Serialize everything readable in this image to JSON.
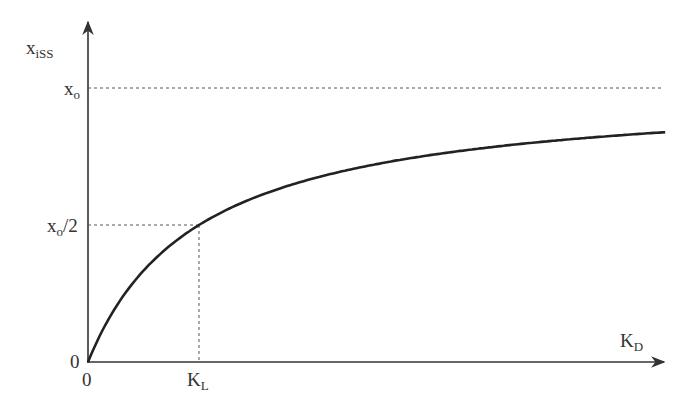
{
  "chart_data": {
    "type": "line",
    "title": "",
    "xlabel": "K_D",
    "ylabel": "x_iSS",
    "xlabel_main": "K",
    "xlabel_sub": "D",
    "ylabel_main": "x",
    "ylabel_sub": "iSS",
    "x_ticks": [
      {
        "label_main": "0",
        "label_sub": "",
        "value": 0
      },
      {
        "label_main": "K",
        "label_sub": "L",
        "value": 1
      }
    ],
    "y_ticks": [
      {
        "label_main": "0",
        "label_sub": "",
        "label_suffix": "",
        "value": 0
      },
      {
        "label_main": "x",
        "label_sub": "o",
        "label_suffix": "/2",
        "value": 0.5
      },
      {
        "label_main": "x",
        "label_sub": "o",
        "label_suffix": "",
        "value": 1
      }
    ],
    "series": [
      {
        "name": "x_iSS(K_D) = x_o · K_D / (K_D + K_L)",
        "formula": "x_o*K_D/(K_D+K_L)",
        "x": [
          0,
          0.25,
          0.5,
          1,
          1.5,
          2,
          2.5,
          3,
          4,
          5.2
        ],
        "values": [
          0,
          0.2,
          0.333,
          0.5,
          0.6,
          0.667,
          0.714,
          0.75,
          0.8,
          0.839
        ]
      }
    ],
    "reference_lines": [
      {
        "orientation": "horizontal",
        "y": 1,
        "label": "x_o",
        "style": "dashed"
      },
      {
        "orientation": "horizontal",
        "y": 0.5,
        "label": "x_o/2",
        "style": "dashed",
        "until_x": 1
      },
      {
        "orientation": "vertical",
        "x": 1,
        "label": "K_L",
        "style": "dashed",
        "until_y": 0.5
      }
    ],
    "xlim": [
      0,
      5.2
    ],
    "ylim": [
      0,
      1
    ],
    "grid": false,
    "legend": "none"
  },
  "colors": {
    "curve": "#222222",
    "axis": "#333333",
    "dashed": "#555555",
    "background": "#ffffff"
  }
}
